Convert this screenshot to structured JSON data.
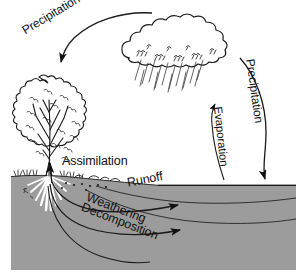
{
  "figure": {
    "background_color": "#ffffff",
    "ink_color": "#111111",
    "ground_color": "#9c9c9c",
    "water_color": "#9c9c9c",
    "root_color": "#ffffff"
  },
  "labels": {
    "precipitation_left": "Precipitation",
    "precipitation_right": "Precipitation",
    "evaporation": "Evaporation",
    "assimilation": "Assimilation",
    "runoff": "Runoff",
    "weathering": "Weathering",
    "decomposition": "Decomposition"
  },
  "elements": {
    "cloud": "rain-cloud",
    "tree": "deciduous-tree",
    "rain": "rain-streaks",
    "roots": "tree-roots",
    "grass": "grass-tufts",
    "rocks": "soil-pebbles",
    "water_body": "lake",
    "soil": "soil-cross-section"
  },
  "arrows": [
    {
      "name": "precipitation-left-arrow",
      "from": "cloud",
      "to": "tree",
      "direction": "down-left"
    },
    {
      "name": "precipitation-right-arrow",
      "from": "cloud",
      "to": "lake",
      "direction": "down"
    },
    {
      "name": "evaporation-arrow",
      "from": "lake",
      "to": "cloud",
      "direction": "up"
    },
    {
      "name": "assimilation-arrow",
      "from": "soil",
      "to": "tree",
      "direction": "up"
    },
    {
      "name": "weathering-arrow",
      "from": "soil",
      "to": "lake",
      "direction": "right"
    },
    {
      "name": "decomposition-arrow",
      "from": "soil",
      "to": "lake",
      "direction": "right"
    }
  ]
}
